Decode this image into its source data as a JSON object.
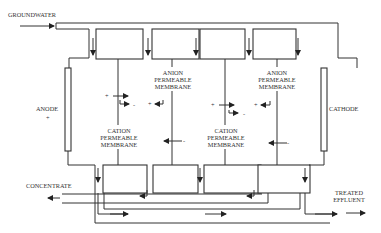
{
  "diagram": {
    "type": "electrodialysis-process-schematic",
    "inputs": {
      "groundwater": {
        "label": "GROUNDWATER"
      }
    },
    "outputs": {
      "concentrate": {
        "label": "CONCENTRATE"
      },
      "treated_effluent": {
        "label_line1": "TREATED",
        "label_line2": "EFFLUENT"
      }
    },
    "electrodes": {
      "anode": {
        "label": "ANODE",
        "sign": "+"
      },
      "cathode": {
        "label": "CATHODE"
      }
    },
    "membranes": [
      {
        "id": "cation-1",
        "line1": "CATION",
        "line2": "PERMEABLE",
        "line3": "MEMBRANE"
      },
      {
        "id": "anion-1",
        "line1": "ANION",
        "line2": "PERMEABLE",
        "line3": "MEMBRANE"
      },
      {
        "id": "cation-2",
        "line1": "CATION",
        "line2": "PERMEABLE",
        "line3": "MEMBRANE"
      },
      {
        "id": "anion-2",
        "line1": "ANION",
        "line2": "PERMEABLE",
        "line3": "MEMBRANE"
      }
    ],
    "ion_signs": {
      "plus": "+",
      "minus": "-"
    }
  }
}
